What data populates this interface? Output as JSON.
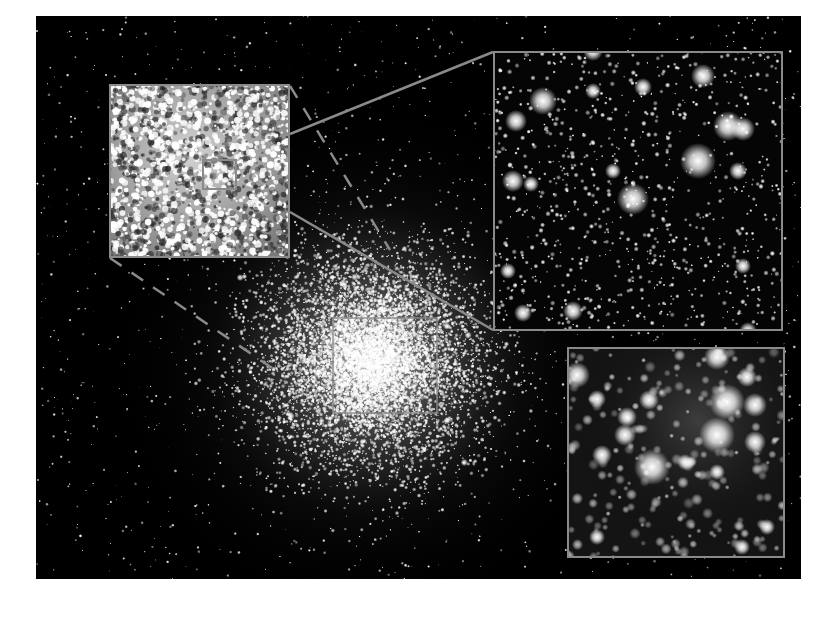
{
  "image": {
    "subject": "globular star cluster with zoom insets",
    "background_color": "#000000",
    "page_color": "#ffffff",
    "frame_color": "#8a8a8a"
  },
  "main_field": {
    "x": 36,
    "y": 16,
    "w": 765,
    "h": 563,
    "core": {
      "cx": 370,
      "cy": 360
    }
  },
  "regions": {
    "core_box": {
      "x": 333,
      "y": 318,
      "w": 104,
      "h": 95
    },
    "left_inset": {
      "x": 109,
      "y": 84,
      "w": 181,
      "h": 174
    },
    "left_inset_subbox": {
      "x": 203,
      "y": 160,
      "w": 33,
      "h": 29
    },
    "top_right_inset": {
      "x": 493,
      "y": 51,
      "w": 290,
      "h": 280
    },
    "bottom_right_inset": {
      "x": 567,
      "y": 347,
      "w": 218,
      "h": 211
    }
  },
  "connector_lines": [
    {
      "style": "dashed",
      "x1": 290,
      "y1": 86,
      "x2": 390,
      "y2": 250
    },
    {
      "style": "dashed",
      "x1": 110,
      "y1": 258,
      "x2": 275,
      "y2": 370
    },
    {
      "style": "solid",
      "x1": 290,
      "y1": 134,
      "x2": 493,
      "y2": 52
    },
    {
      "style": "solid",
      "x1": 290,
      "y1": 212,
      "x2": 493,
      "y2": 330
    }
  ]
}
